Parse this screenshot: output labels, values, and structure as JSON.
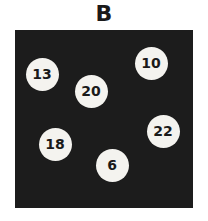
{
  "title": "B",
  "balls": [
    {
      "label": "13",
      "cx": 42,
      "cy": 74
    },
    {
      "label": "20",
      "cx": 91,
      "cy": 91
    },
    {
      "label": "10",
      "cx": 151,
      "cy": 63
    },
    {
      "label": "22",
      "cx": 163,
      "cy": 131
    },
    {
      "label": "18",
      "cx": 55,
      "cy": 144
    },
    {
      "label": "6",
      "cx": 112,
      "cy": 165
    }
  ],
  "colors": {
    "panel": "#1c1c1c",
    "ball": "#f4f3ef",
    "text": "#1a1a1a"
  }
}
